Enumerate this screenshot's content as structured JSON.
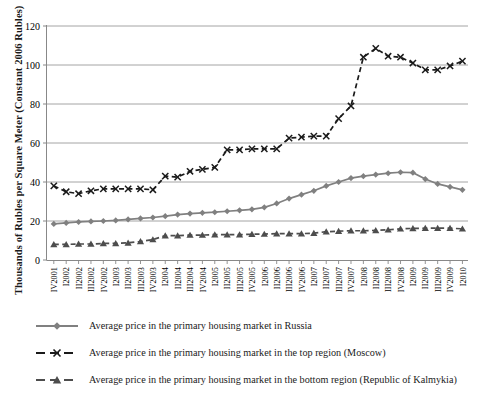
{
  "chart_data": {
    "type": "line",
    "title": "",
    "xlabel": "",
    "ylabel": "Thousands of Rubles per Square Meter (Constant 2006 Rubles)",
    "ylim": [
      0,
      120
    ],
    "yticks": [
      0,
      20,
      40,
      60,
      80,
      100,
      120
    ],
    "ytick_labels": [
      "0",
      "20",
      "40",
      "60",
      "80",
      "100",
      "120"
    ],
    "grid": true,
    "legend_position": "bottom",
    "categories": [
      "IV2001",
      "I2002",
      "II2002",
      "III2002",
      "IV2002",
      "I2003",
      "II2003",
      "III2003",
      "IV2003",
      "I2004",
      "II2004",
      "III2004",
      "IV2004",
      "I2005",
      "II2005",
      "III2005",
      "IV2005",
      "I2006",
      "II2006",
      "III2006",
      "IV2006",
      "I2007",
      "II2007",
      "III2007",
      "IV2007",
      "I2008",
      "II2008",
      "III2008",
      "IV2008",
      "I2009",
      "II2009",
      "III2009",
      "IV2009",
      "I2010"
    ],
    "series": [
      {
        "name": "Average price in the primary housing market in Russia",
        "color": "#808080",
        "marker": "diamond",
        "dashed": false,
        "values": [
          18.5,
          19.0,
          19.5,
          19.8,
          20.0,
          20.3,
          20.8,
          21.3,
          21.8,
          22.5,
          23.3,
          23.8,
          24.2,
          24.5,
          25.0,
          25.5,
          26.0,
          27.0,
          29.0,
          31.5,
          33.5,
          35.5,
          38.0,
          40.0,
          42.0,
          43.0,
          43.8,
          44.5,
          45.0,
          44.8,
          41.5,
          39.0,
          37.5,
          36.0
        ]
      },
      {
        "name": "Average price in the primary housing market in the top region (Moscow)",
        "color": "#1a1a1a",
        "marker": "cross",
        "dashed": true,
        "values": [
          38.0,
          35.0,
          34.0,
          35.5,
          36.5,
          36.5,
          36.5,
          36.5,
          36.0,
          43.0,
          42.5,
          45.5,
          46.5,
          47.5,
          56.5,
          56.5,
          57.0,
          57.0,
          57.0,
          62.5,
          63.0,
          63.5,
          63.5,
          72.5,
          79.0,
          91.0,
          90.0,
          102.0,
          102.5,
          103.5,
          103.5,
          103.0,
          103.0,
          103.5
        ]
      },
      {
        "name": "Average price in the primary housing market in the bottom region (Republic of Kalmykia)",
        "color": "#4d4d4d",
        "marker": "triangle",
        "dashed": true,
        "values": [
          8.0,
          8.0,
          8.2,
          8.2,
          8.5,
          8.5,
          8.8,
          9.5,
          10.5,
          12.5,
          12.5,
          12.8,
          12.8,
          13.0,
          13.0,
          13.0,
          13.2,
          13.3,
          13.5,
          13.5,
          13.5,
          13.8,
          14.5,
          14.8,
          15.0,
          15.0,
          15.2,
          15.5,
          16.0,
          16.2,
          16.3,
          16.3,
          16.3,
          16.0
        ]
      }
    ],
    "extra_series_tail": {
      "note": "Moscow late-period detail",
      "moscow_tail": [
        104.0,
        108.5,
        104.5,
        104.0,
        101.0,
        97.5,
        97.5,
        99.5,
        102.0
      ]
    }
  },
  "axis": {
    "y_title": "Thousands of Rubles per Square Meter (Constant 2006 Rubles)"
  },
  "legend": {
    "items": [
      {
        "key_name": "legend-key-russia",
        "label": "Average price in the primary housing market in Russia"
      },
      {
        "key_name": "legend-key-moscow",
        "label": "Average price in the primary housing market in the top region (Moscow)"
      },
      {
        "key_name": "legend-key-kalmykia",
        "label": "Average price in the primary housing market in the bottom region (Republic of Kalmykia)"
      }
    ]
  }
}
